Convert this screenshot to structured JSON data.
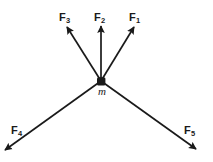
{
  "diagram": {
    "width": 213,
    "height": 162,
    "background_color": "#ffffff",
    "stroke_color": "#1a1a1a",
    "mass_point": {
      "label": "m",
      "x": 101,
      "y": 81,
      "radius": 4.5
    },
    "vectors": [
      {
        "name": "F1",
        "label": "F",
        "subscript": "1",
        "from_x": 101,
        "from_y": 81,
        "to_x": 134,
        "to_y": 27,
        "label_x": 129,
        "label_y": 12
      },
      {
        "name": "F2",
        "label": "F",
        "subscript": "2",
        "from_x": 101,
        "from_y": 81,
        "to_x": 101,
        "to_y": 26,
        "label_x": 94,
        "label_y": 12
      },
      {
        "name": "F3",
        "label": "F",
        "subscript": "3",
        "from_x": 101,
        "from_y": 81,
        "to_x": 67,
        "to_y": 27,
        "label_x": 59,
        "label_y": 12
      },
      {
        "name": "F4",
        "label": "F",
        "subscript": "4",
        "from_x": 101,
        "from_y": 81,
        "to_x": 4,
        "to_y": 151,
        "label_x": 11,
        "label_y": 125
      },
      {
        "name": "F5",
        "label": "F",
        "subscript": "5",
        "from_x": 101,
        "from_y": 81,
        "to_x": 197,
        "to_y": 150,
        "label_x": 184,
        "label_y": 125
      }
    ]
  }
}
